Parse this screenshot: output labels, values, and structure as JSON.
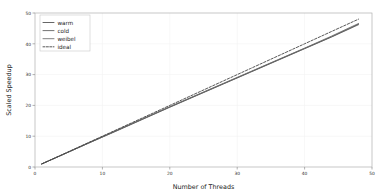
{
  "chart_data": {
    "type": "line",
    "title": "",
    "xlabel": "Number of Threads",
    "ylabel": "Scaled Speedup",
    "xlim": [
      0,
      50
    ],
    "ylim": [
      0,
      50
    ],
    "xticks": [
      0,
      10,
      20,
      30,
      40,
      50
    ],
    "yticks": [
      0,
      10,
      20,
      30,
      40,
      50
    ],
    "xtick_labels": [
      "0",
      "10",
      "20",
      "30",
      "40",
      "50"
    ],
    "ytick_labels": [
      "0",
      "10",
      "20",
      "30",
      "40",
      "50"
    ],
    "grid": true,
    "legend_position": "upper-left",
    "x": [
      1,
      4,
      8,
      12,
      16,
      20,
      24,
      28,
      32,
      36,
      40,
      44,
      48
    ],
    "series": [
      {
        "name": "warm",
        "style": "solid",
        "color": "#4a4a4a",
        "values": [
          1.0,
          3.9,
          7.8,
          11.7,
          15.6,
          19.5,
          23.3,
          27.1,
          30.9,
          34.7,
          38.5,
          42.3,
          46.4
        ]
      },
      {
        "name": "cold",
        "style": "solid",
        "color": "#5a5a5a",
        "values": [
          1.0,
          3.9,
          7.8,
          11.6,
          15.5,
          19.4,
          23.2,
          27.0,
          30.8,
          34.6,
          38.4,
          42.2,
          46.2
        ]
      },
      {
        "name": "weibel",
        "style": "solid",
        "color": "#6a6a6a",
        "values": [
          1.0,
          3.9,
          7.9,
          11.8,
          15.7,
          19.6,
          23.4,
          27.2,
          31.0,
          34.8,
          38.6,
          42.5,
          46.6
        ]
      },
      {
        "name": "ideal",
        "style": "dashed",
        "color": "#3a3a3a",
        "values": [
          1.0,
          4.0,
          8.0,
          12.0,
          16.0,
          20.0,
          24.0,
          28.0,
          32.0,
          36.0,
          40.0,
          44.0,
          48.0
        ]
      }
    ]
  },
  "legend": {
    "entries": [
      {
        "label": "warm"
      },
      {
        "label": "cold"
      },
      {
        "label": "weibel"
      },
      {
        "label": "ideal"
      }
    ]
  },
  "axes": {
    "x_title": "Number of Threads",
    "y_title": "Scaled Speedup"
  },
  "colors": {
    "background": "#ffffff",
    "frame": "#b0b0b0",
    "grid": "#f2f2f2",
    "text": "#1a1a1a",
    "tick": "#2b2b2b"
  }
}
